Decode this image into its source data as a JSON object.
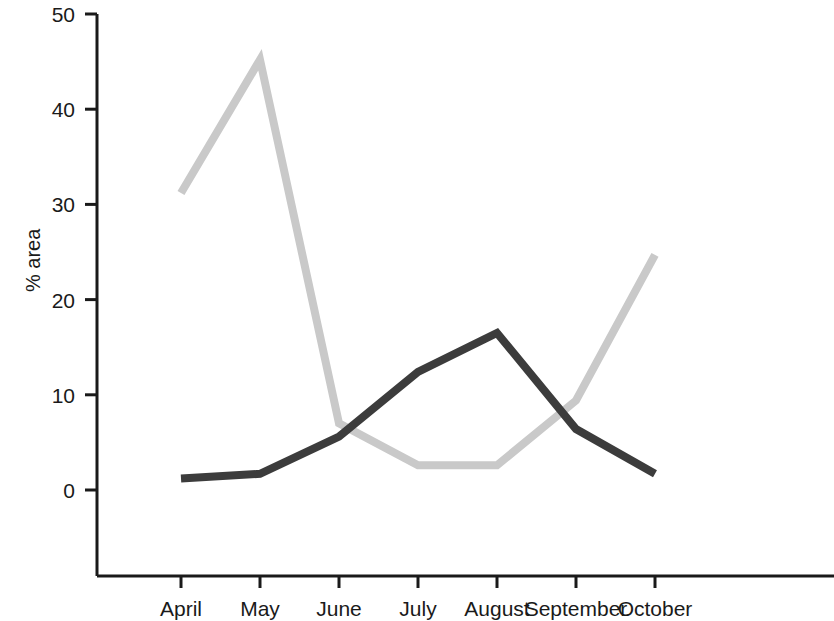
{
  "chart_data": {
    "type": "line",
    "title": "",
    "subtitle": "",
    "xlabel": "",
    "ylabel": "% area",
    "categories": [
      "April",
      "May",
      "June",
      "July",
      "August",
      "September",
      "October"
    ],
    "ylim": [
      0,
      50
    ],
    "yticks": [
      0,
      10,
      20,
      30,
      40,
      50
    ],
    "ytick_labels": [
      "0",
      "10",
      "20",
      "30",
      "40",
      "50"
    ],
    "grid": false,
    "legend": "none",
    "series": [
      {
        "name": "light-gray-series",
        "color": "#c9c9c9",
        "values": [
          31.2,
          45.2,
          7.0,
          2.6,
          2.6,
          9.4,
          24.7
        ]
      },
      {
        "name": "dark-gray-series",
        "color": "#3c3c3c",
        "values": [
          1.2,
          1.7,
          5.6,
          12.4,
          16.5,
          6.4,
          1.7
        ]
      }
    ],
    "axis_color": "#1a1a1a"
  },
  "axis": {
    "y_title": "% area"
  }
}
